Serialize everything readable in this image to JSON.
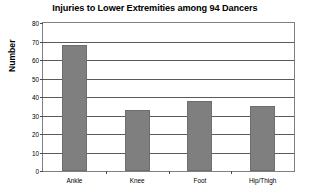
{
  "chart_data": {
    "type": "bar",
    "title": "Injuries to Lower Extremities among 94 Dancers",
    "xlabel": "",
    "ylabel": "Number",
    "categories": [
      "Ankle",
      "Knee",
      "Foot",
      "Hip/Thigh"
    ],
    "values": [
      68,
      33,
      38,
      35
    ],
    "ylim": [
      0,
      80
    ],
    "ytick_step": 10,
    "yticks": [
      0,
      10,
      20,
      30,
      40,
      50,
      60,
      70,
      80
    ],
    "ytick_labels": [
      "0",
      "10",
      "20",
      "30",
      "40",
      "50",
      "60",
      "70",
      "80"
    ],
    "grid": true,
    "grid_axis": "y",
    "legend": false,
    "legend_position": "none",
    "bar_color": "#7f7f7f",
    "bar_edge_color": "#6e6e6e",
    "plot_border_color": "#808080",
    "gridline_color": "#5a5a5a",
    "background_color": "#ffffff"
  }
}
